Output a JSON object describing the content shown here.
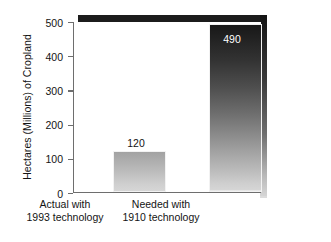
{
  "chart_data": {
    "type": "bar",
    "title": "",
    "subtitle": "",
    "xlabel": "",
    "ylabel": "Hectares (Millions) of Cropland",
    "categories": [
      "Actual with 1993 technology",
      "Needed with 1910 technology"
    ],
    "category_lines": [
      [
        "Actual with",
        "1993 technology"
      ],
      [
        "Needed with",
        "1910 technology"
      ]
    ],
    "values": [
      120,
      490
    ],
    "value_labels": [
      "120",
      "490"
    ],
    "ylim": [
      0,
      500
    ],
    "yticks": [
      0,
      100,
      200,
      300,
      400,
      500
    ],
    "ytick_labels": [
      "0",
      "100",
      "200",
      "300",
      "400",
      "500"
    ],
    "grid": false,
    "legend": false,
    "legend_position": "none",
    "bar_style": "vertical-gradient-dark-top-to-light-bottom",
    "colors": {
      "bar_gradient_top": "#141414",
      "bar_gradient_bottom": "#d6d6d6",
      "axis": "#6e6e6e",
      "text": "#141414",
      "value_label_inside": "#ffffff",
      "frame_shadow": "#1c1c1c",
      "background": "#ffffff"
    }
  }
}
